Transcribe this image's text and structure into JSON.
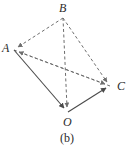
{
  "figure": {
    "caption": "(b)",
    "type": "tetrahedron-vector-diagram",
    "canvas": {
      "width": 134,
      "height": 152,
      "background": "#ffffff"
    },
    "stroke": {
      "solid_color": "#4a4a4a",
      "dashed_color": "#6e6e6e",
      "width": 1,
      "dash_pattern": "3,2.5"
    },
    "vertices": [
      {
        "id": "A",
        "label": "A",
        "x": 14,
        "y": 50
      },
      {
        "id": "B",
        "label": "B",
        "x": 63,
        "y": 18
      },
      {
        "id": "C",
        "label": "C",
        "x": 110,
        "y": 86
      },
      {
        "id": "O",
        "label": "O",
        "x": 68,
        "y": 112
      }
    ],
    "edges": [
      {
        "id": "BA",
        "from": "B",
        "to": "A",
        "style": "dashed",
        "arrow": "to"
      },
      {
        "id": "BC",
        "from": "B",
        "to": "C",
        "style": "dashed",
        "arrow": "to"
      },
      {
        "id": "BO",
        "from": "B",
        "to": "O",
        "style": "dashed",
        "arrow": "to"
      },
      {
        "id": "AC",
        "from": "A",
        "to": "C",
        "style": "dashed",
        "arrow": "to"
      },
      {
        "id": "AO",
        "from": "A",
        "to": "O",
        "style": "solid",
        "arrow": "to"
      },
      {
        "id": "OC",
        "from": "O",
        "to": "C",
        "style": "solid",
        "arrow": "to"
      },
      {
        "id": "CA",
        "from": "C",
        "to": "A",
        "style": "dashed",
        "arrow": "to"
      }
    ]
  }
}
